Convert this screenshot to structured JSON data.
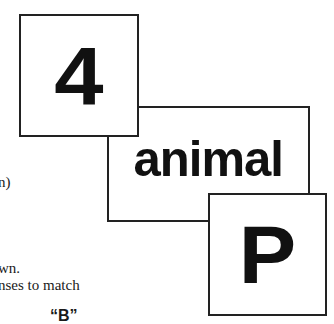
{
  "cards": [
    {
      "label": "4"
    },
    {
      "label": "animal"
    },
    {
      "label": "P"
    }
  ],
  "text_fragments": [
    "n)",
    "wn.",
    "nses to match",
    "“B”"
  ],
  "colors": {
    "border": "#222222",
    "text": "#111111",
    "background": "#ffffff"
  }
}
